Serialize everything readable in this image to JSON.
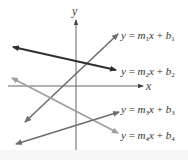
{
  "diagram": {
    "type": "coordinate-plane-lines",
    "axes": {
      "x_label": "x",
      "y_label": "y"
    },
    "lines": [
      {
        "id": 1,
        "m": "m",
        "m_sub": "1",
        "b": "b",
        "b_sub": "1",
        "y": "y",
        "eq": "=",
        "x": "x",
        "plus": "+",
        "color": "#6e6e6e"
      },
      {
        "id": 2,
        "m": "m",
        "m_sub": "2",
        "b": "b",
        "b_sub": "2",
        "y": "y",
        "eq": "=",
        "x": "x",
        "plus": "+",
        "color": "#2f2f2f"
      },
      {
        "id": 3,
        "m": "m",
        "m_sub": "3",
        "b": "b",
        "b_sub": "3",
        "y": "y",
        "eq": "=",
        "x": "x",
        "plus": "+",
        "color": "#6e6e6e"
      },
      {
        "id": 4,
        "m": "m",
        "m_sub": "4",
        "b": "b",
        "b_sub": "4",
        "y": "y",
        "eq": "=",
        "x": "x",
        "plus": "+",
        "color": "#a0a0a0"
      }
    ],
    "colors": {
      "axis": "#555555",
      "background": "#ffffff"
    }
  }
}
